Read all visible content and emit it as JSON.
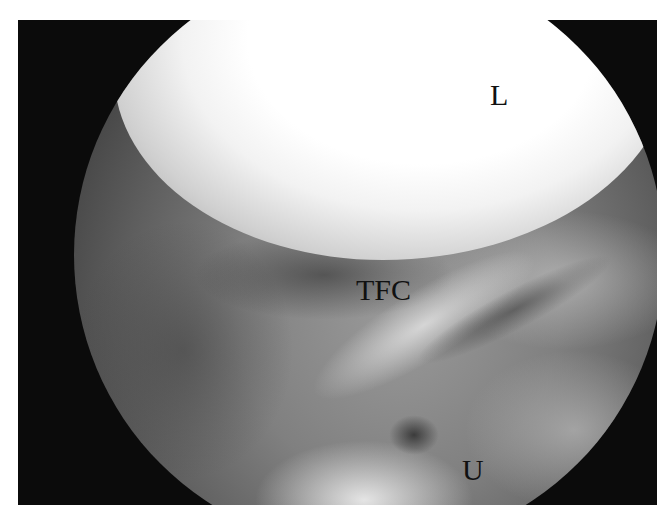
{
  "image": {
    "description": "Arthroscopic view of the wrist showing lunate, triangular fibrocartilage and ulna",
    "labels": {
      "lunate": "L",
      "tfc": "TFC",
      "ulna": "U"
    },
    "colors": {
      "background": "#ffffff",
      "frame": "#0b0b0b",
      "label": "#111111"
    }
  }
}
